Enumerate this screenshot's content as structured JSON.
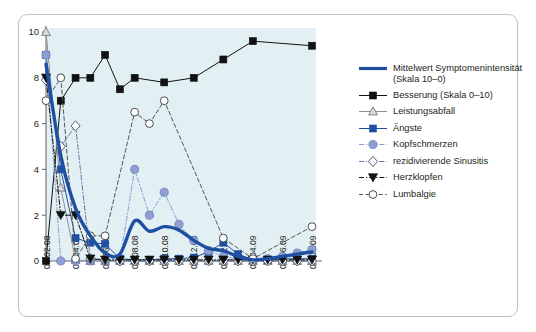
{
  "chart_data": {
    "type": "line",
    "title": "",
    "xlabel": "",
    "ylabel": "",
    "ylim": [
      0,
      10
    ],
    "yticks": [
      0,
      2,
      4,
      6,
      8,
      10
    ],
    "grid": false,
    "legend_position": "right",
    "background_color": "#e3f0f3",
    "frame_color": "#b9c3cc",
    "x": [
      "08.02.08",
      "08.03.08",
      "08.04.08",
      "08.05.08",
      "08.06.08",
      "08.07.08",
      "08.08.08",
      "08.09.08",
      "08.10.08",
      "08.11.08",
      "08.12.08",
      "08.01.09",
      "08.02.09",
      "08.03.09",
      "08.04.09",
      "08.05.09",
      "08.06.09",
      "08.07.09",
      "08.08.09"
    ],
    "xtick_labels": [
      "08.02.08",
      "08.04.08",
      "08.06.08",
      "08.08.08",
      "08.10.08",
      "08.12.08",
      "08.02.09",
      "08.04.09",
      "08.06.09",
      "08.08.09"
    ],
    "series": [
      {
        "name": "Mittelwert Symptomenintensität (Skala 10–0)",
        "legend_label": "Mittelwert Symptomenintensität\n(Skala 10–0)",
        "color": "#1f4fa0",
        "marker": "none",
        "linestyle": "solid",
        "linewidth": 3.4,
        "smooth": true,
        "values": [
          8.6,
          4.6,
          2.3,
          1.1,
          0.35,
          0.3,
          1.75,
          1.3,
          1.5,
          1.35,
          0.9,
          0.55,
          0.45,
          0.2,
          0.05,
          0.1,
          0.2,
          0.3,
          0.4
        ]
      },
      {
        "name": "Besserung (Skala 0–10)",
        "legend_label": "Besserung (Skala 0–10)",
        "color": "#111111",
        "marker": "square-filled",
        "linestyle": "solid",
        "linewidth": 1,
        "values": [
          0,
          7,
          8,
          8,
          9,
          7.5,
          8,
          null,
          7.8,
          null,
          8.0,
          null,
          8.8,
          null,
          9.6,
          null,
          null,
          null,
          9.4
        ]
      },
      {
        "name": "Leistungsabfall",
        "legend_label": "Leistungsabfall",
        "color": "#8c9196",
        "marker": "triangle-up-open",
        "linestyle": "solid",
        "linewidth": 1,
        "values": [
          10,
          3.2,
          0.05,
          0,
          0,
          0,
          0,
          0,
          0,
          0,
          0,
          0,
          0,
          0,
          0,
          0,
          0,
          0,
          0
        ]
      },
      {
        "name": "Ängste",
        "legend_label": "Ängste",
        "color": "#1f4fa0",
        "marker": "square-filled",
        "linestyle": "solid",
        "linewidth": 1,
        "values": [
          9,
          4.0,
          1.0,
          0.8,
          0.75,
          0.1,
          0.05,
          0.05,
          0.1,
          0.1,
          0.15,
          0.4,
          0.8,
          0.3,
          0.05,
          0.05,
          0.1,
          0.1,
          0.1
        ]
      },
      {
        "name": "Kopfschmerzen",
        "legend_label": "Kopfschmerzen",
        "color": "#8d9fd4",
        "marker": "circle-filled",
        "linestyle": "dashdot",
        "linewidth": 1,
        "values": [
          9,
          0,
          0,
          0,
          0,
          0,
          4.0,
          2.0,
          3.0,
          1.6,
          0.9,
          0.45,
          0.2,
          0.08,
          0.05,
          0.1,
          0.2,
          0.35,
          0.5
        ]
      },
      {
        "name": "rezidivierende Sinusitis",
        "legend_label": "rezidivierende Sinusitis",
        "color": "#6b7aa8",
        "marker": "diamond-open",
        "linestyle": "dashdot",
        "linewidth": 1,
        "values": [
          7.9,
          5.0,
          5.9,
          0.1,
          0.05,
          0,
          0,
          0,
          0,
          0,
          0,
          0,
          0,
          0,
          0,
          0,
          0,
          0,
          0
        ]
      },
      {
        "name": "Herzklopfen",
        "legend_label": "Herzklopfen",
        "color": "#111111",
        "marker": "triangle-down-filled",
        "linestyle": "dashdot",
        "linewidth": 1,
        "values": [
          8,
          2.0,
          2.0,
          0.1,
          0.05,
          0.05,
          0.05,
          0.05,
          0.05,
          0.05,
          0.05,
          0.05,
          0.05,
          0.05,
          0.05,
          0.05,
          0.05,
          0.05,
          0.05
        ]
      },
      {
        "name": "Lumbalgie",
        "legend_label": "Lumbalgie",
        "color": "#555555",
        "marker": "circle-open",
        "linestyle": "dashed",
        "linewidth": 1,
        "values": [
          7.0,
          8.0,
          0.1,
          1.1,
          1.1,
          null,
          6.5,
          6.0,
          7.0,
          null,
          null,
          null,
          1.0,
          null,
          0.1,
          null,
          null,
          null,
          1.5
        ]
      }
    ]
  },
  "axis": {
    "y_tick_labels": [
      "0",
      "2",
      "4",
      "6",
      "8",
      "10"
    ]
  }
}
